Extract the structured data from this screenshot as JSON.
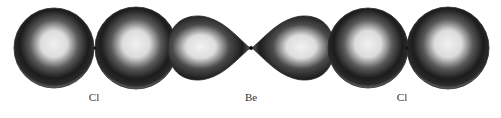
{
  "diagram": {
    "labels": [
      {
        "id": "cl-left",
        "text": "Cl",
        "x": 94,
        "y": 91
      },
      {
        "id": "be-center",
        "text": "Be",
        "x": 251,
        "y": 91
      },
      {
        "id": "cl-right",
        "text": "Cl",
        "x": 402,
        "y": 91
      }
    ],
    "colors": {
      "orbital_dark": "#1a1a1a",
      "orbital_light": "#e8e8e8",
      "outline": "#2a2a2a",
      "background": "#ffffff",
      "label": "#333333"
    }
  }
}
